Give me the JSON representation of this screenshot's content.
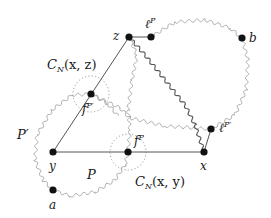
{
  "diagram": {
    "type": "graph-figure",
    "nodes": [
      {
        "id": "z",
        "label": "z",
        "x": 129,
        "y": 37
      },
      {
        "id": "lP",
        "label": "ℓ^P",
        "x": 151,
        "y": 37
      },
      {
        "id": "b",
        "label": "b",
        "x": 242,
        "y": 38
      },
      {
        "id": "fPp",
        "label": "f^{P'}",
        "x": 91,
        "y": 94
      },
      {
        "id": "y",
        "label": "y",
        "x": 53,
        "y": 152
      },
      {
        "id": "fP",
        "label": "f^P",
        "x": 128,
        "y": 152
      },
      {
        "id": "x",
        "label": "x",
        "x": 204,
        "y": 152
      },
      {
        "id": "lPp",
        "label": "ℓ^{P'}",
        "x": 211,
        "y": 129
      },
      {
        "id": "a",
        "label": "a",
        "x": 53,
        "y": 190
      }
    ],
    "straight_edges": [
      [
        "z",
        "lP"
      ],
      [
        "z",
        "fPp"
      ],
      [
        "fPp",
        "y"
      ],
      [
        "y",
        "fP"
      ],
      [
        "fP",
        "x"
      ],
      [
        "x",
        "lPp"
      ]
    ],
    "wavy_paths": [
      {
        "name": "P-prime-loop",
        "description": "light wavy loop around y from a to f^{P'}"
      },
      {
        "name": "P-path",
        "description": "light wavy path from a toward f^P"
      },
      {
        "name": "right-loop",
        "description": "light wavy loop from ℓ^P over b down to ℓ^{P'}"
      },
      {
        "name": "z-to-x",
        "description": "dark wavy path from z to x"
      },
      {
        "name": "z-to-fP",
        "description": "light wavy path from z down to f^P"
      },
      {
        "name": "fPp-to-lPp",
        "description": "light wavy path from f^{P'} to ℓ^{P'}"
      }
    ],
    "dotted_circles": [
      {
        "name": "C_N(x,z)",
        "center": "fPp",
        "r": 18
      },
      {
        "name": "C_N(x,y)",
        "center": "fP",
        "r": 18
      }
    ],
    "labels": {
      "z": "z",
      "lP_base": "ℓ",
      "lP_sup": "P",
      "b": "b",
      "cnxz_C": "C",
      "cnxz_sub": "N",
      "cnxz_args": "(x, z)",
      "fPp_base": "f",
      "fPp_sup": "P′",
      "P_prime": "P′",
      "y": "y",
      "fP_base": "f",
      "fP_sup": "P",
      "x": "x",
      "lPp_base": "ℓ",
      "lPp_sup": "P′",
      "P": "P",
      "cnxy_C": "C",
      "cnxy_sub": "N",
      "cnxy_args": "(x, y)",
      "a": "a"
    },
    "colors": {
      "node": "#111111",
      "straight_edge": "#555555",
      "wavy_light": "#b0b0b0",
      "wavy_dark": "#555555",
      "dotted_circle": "#999999"
    }
  }
}
